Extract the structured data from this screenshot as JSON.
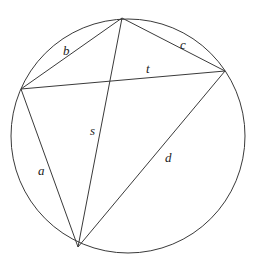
{
  "diagram": {
    "stroke_color": "#3a3a3a",
    "label_color": "#222222",
    "circle": {
      "cx": 128,
      "cy": 136,
      "r": 117
    },
    "vertices": {
      "top": {
        "x": 122,
        "y": 18
      },
      "left": {
        "x": 21,
        "y": 89
      },
      "right": {
        "x": 225,
        "y": 71
      },
      "bottom": {
        "x": 78,
        "y": 247
      }
    },
    "segments": [
      {
        "name": "b",
        "from": "left",
        "to": "top",
        "kind": "side"
      },
      {
        "name": "c",
        "from": "top",
        "to": "right",
        "kind": "side"
      },
      {
        "name": "d",
        "from": "right",
        "to": "bottom",
        "kind": "side"
      },
      {
        "name": "a",
        "from": "bottom",
        "to": "left",
        "kind": "side"
      },
      {
        "name": "t",
        "from": "left",
        "to": "right",
        "kind": "diagonal"
      },
      {
        "name": "s",
        "from": "top",
        "to": "bottom",
        "kind": "diagonal"
      }
    ],
    "labels": {
      "a": {
        "text": "a",
        "x": 38,
        "y": 175
      },
      "b": {
        "text": "b",
        "x": 63,
        "y": 55
      },
      "c": {
        "text": "c",
        "x": 180,
        "y": 49
      },
      "d": {
        "text": "d",
        "x": 165,
        "y": 162
      },
      "s": {
        "text": "s",
        "x": 90,
        "y": 135
      },
      "t": {
        "text": "t",
        "x": 146,
        "y": 73
      }
    }
  }
}
